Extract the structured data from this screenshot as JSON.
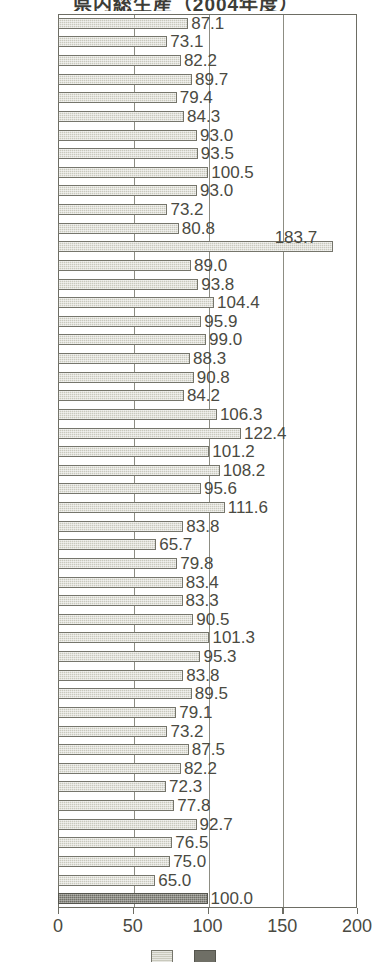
{
  "chart_data": {
    "type": "bar",
    "orientation": "horizontal",
    "title": "県内総生産（2004年度）",
    "xlabel": "",
    "ylabel": "",
    "xlim": [
      0,
      200
    ],
    "xticks": [
      0,
      50,
      100,
      150,
      200
    ],
    "xtick_labels": [
      "0",
      "50",
      "100",
      "150",
      "200"
    ],
    "grid": true,
    "gridlines_at": [
      50,
      100,
      150
    ],
    "legend_position": "bottom",
    "categories": [
      "1",
      "2",
      "3",
      "4",
      "5",
      "6",
      "7",
      "8",
      "9",
      "10",
      "11",
      "12",
      "13",
      "14",
      "15",
      "16",
      "17",
      "18",
      "19",
      "20",
      "21",
      "22",
      "23",
      "24",
      "25",
      "26",
      "27",
      "28",
      "29",
      "30",
      "31",
      "32",
      "33",
      "34",
      "35",
      "36",
      "37",
      "38",
      "39",
      "40",
      "41",
      "42",
      "43",
      "44",
      "45",
      "46",
      "47",
      "48"
    ],
    "values": [
      87.1,
      73.1,
      82.2,
      89.7,
      79.4,
      84.3,
      93.0,
      93.5,
      100.5,
      93.0,
      73.2,
      80.8,
      183.7,
      89.0,
      93.8,
      104.4,
      95.9,
      99.0,
      88.3,
      90.8,
      84.2,
      106.3,
      122.4,
      101.2,
      108.2,
      95.6,
      111.6,
      83.8,
      65.7,
      79.8,
      83.4,
      83.3,
      90.5,
      101.3,
      95.3,
      83.8,
      89.5,
      79.1,
      73.2,
      87.5,
      82.2,
      72.3,
      77.8,
      92.7,
      76.5,
      75.0,
      65.0,
      100.0
    ],
    "data_labels": [
      "87.1",
      "73.1",
      "82.2",
      "89.7",
      "79.4",
      "84.3",
      "93.0",
      "93.5",
      "100.5",
      "93.0",
      "73.2",
      "80.8",
      "183.7",
      "89.0",
      "93.8",
      "104.4",
      "95.9",
      "99.0",
      "88.3",
      "90.8",
      "84.2",
      "106.3",
      "122.4",
      "101.2",
      "108.2",
      "95.6",
      "111.6",
      "83.8",
      "65.7",
      "79.8",
      "83.4",
      "83.3",
      "90.5",
      "101.3",
      "95.3",
      "83.8",
      "89.5",
      "79.1",
      "73.2",
      "87.5",
      "82.2",
      "72.3",
      "77.8",
      "92.7",
      "76.5",
      "75.0",
      "65.0",
      "100.0"
    ],
    "highlight_index": 47,
    "series": [
      {
        "name": "series-light",
        "color": "#c9c9bd"
      },
      {
        "name": "series-highlight",
        "color": "#6f6f66"
      }
    ],
    "colors": {
      "bar_light": "#c9c9bd",
      "bar_dark": "#6f6f66",
      "frame": "#6d6d64",
      "gridline": "#8d8d83",
      "text": "#4a4a42"
    }
  },
  "legend": {
    "entries": [
      {
        "label": "",
        "swatch": "light"
      },
      {
        "label": "",
        "swatch": "dark"
      }
    ]
  }
}
